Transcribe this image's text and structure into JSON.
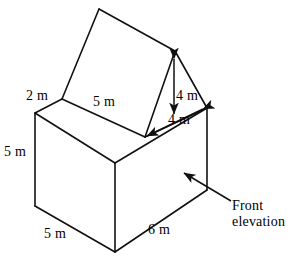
{
  "figure": {
    "stroke_color": "#111111",
    "fill_color": "#ffffff",
    "background_color": "#ffffff",
    "labels": [
      {
        "id": "eaves-2m",
        "text": "2 m",
        "x": 26,
        "y": 88,
        "name": "dimension-label-2m-eaves"
      },
      {
        "id": "roof-5m",
        "text": "5 m",
        "x": 93,
        "y": 94,
        "name": "dimension-label-5m-roof"
      },
      {
        "id": "left-height-5m",
        "text": "5 m",
        "x": 4,
        "y": 144,
        "name": "dimension-label-5m-left-height"
      },
      {
        "id": "bottom-5m",
        "text": "5 m",
        "x": 44,
        "y": 226,
        "name": "dimension-label-5m-bottom"
      },
      {
        "id": "bottom-6m",
        "text": "6 m",
        "x": 148,
        "y": 222,
        "name": "dimension-label-6m-bottom"
      },
      {
        "id": "gable-height-4m",
        "text": "4 m",
        "x": 176,
        "y": 88,
        "name": "dimension-label-4m-vertical"
      },
      {
        "id": "gable-slope-4m",
        "text": "4 m",
        "x": 168,
        "y": 112,
        "name": "dimension-label-4m-diagonal"
      },
      {
        "id": "front-elevation",
        "text": "Front\nelevation",
        "x": 232,
        "y": 198,
        "name": "annotation-front-elevation"
      }
    ],
    "dimensions": [
      {
        "name": "eaves-overhang",
        "value": 2,
        "unit": "m"
      },
      {
        "name": "roof-slope-top",
        "value": 5,
        "unit": "m"
      },
      {
        "name": "wall-height",
        "value": 5,
        "unit": "m"
      },
      {
        "name": "side-depth",
        "value": 5,
        "unit": "m"
      },
      {
        "name": "front-width",
        "value": 6,
        "unit": "m"
      },
      {
        "name": "gable-height",
        "value": 4,
        "unit": "m"
      },
      {
        "name": "gable-slope",
        "value": 4,
        "unit": "m"
      }
    ],
    "annotation": {
      "front_elevation_line1": "Front",
      "front_elevation_line2": "elevation"
    }
  }
}
